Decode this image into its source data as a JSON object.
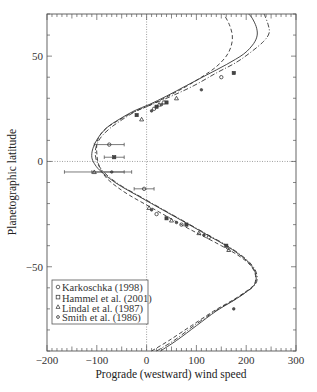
{
  "chart_data": {
    "type": "line",
    "title": "",
    "xlabel": "Prograde (westward) wind speed",
    "ylabel": "Planetographic latitude",
    "xlim": [
      -200,
      300
    ],
    "ylim": [
      -90,
      70
    ],
    "xticks": [
      -200,
      -100,
      0,
      100,
      200,
      300
    ],
    "xtick_labels": [
      "−200",
      "−100",
      "0",
      "100",
      "200",
      "300"
    ],
    "yticks": [
      50,
      0,
      -50
    ],
    "ytick_labels": [
      "50",
      "0",
      "−50"
    ],
    "grid": false,
    "reference_lines": {
      "x": 0,
      "y": 0,
      "style": "dotted"
    },
    "legend_position": "lower left",
    "legend": [
      {
        "label": "Karkoschka (1998)",
        "marker": "circle"
      },
      {
        "label": "Hammel et al. (2001)",
        "marker": "square"
      },
      {
        "label": "Lindal et al. (1987)",
        "marker": "triangle"
      },
      {
        "label": "Smith et al. (1986)",
        "marker": "small-circle"
      }
    ],
    "series": [
      {
        "name": "fit-solid",
        "style": "solid",
        "points": [
          [
            28,
            -90
          ],
          [
            60,
            -85
          ],
          [
            100,
            -78
          ],
          [
            140,
            -71
          ],
          [
            175,
            -66
          ],
          [
            200,
            -62
          ],
          [
            215,
            -59
          ],
          [
            220,
            -56
          ],
          [
            217,
            -52
          ],
          [
            205,
            -48
          ],
          [
            185,
            -44
          ],
          [
            160,
            -40
          ],
          [
            130,
            -36
          ],
          [
            100,
            -32
          ],
          [
            70,
            -28
          ],
          [
            40,
            -24
          ],
          [
            10,
            -20
          ],
          [
            -20,
            -16
          ],
          [
            -50,
            -12
          ],
          [
            -75,
            -8
          ],
          [
            -95,
            -4
          ],
          [
            -105,
            -1
          ],
          [
            -110,
            2
          ],
          [
            -108,
            6
          ],
          [
            -98,
            11
          ],
          [
            -80,
            16
          ],
          [
            -55,
            20
          ],
          [
            -25,
            24
          ],
          [
            5,
            27
          ],
          [
            40,
            31
          ],
          [
            80,
            36
          ],
          [
            120,
            41
          ],
          [
            160,
            46
          ],
          [
            195,
            51
          ],
          [
            215,
            56
          ],
          [
            222,
            60
          ],
          [
            220,
            64
          ],
          [
            212,
            68
          ],
          [
            205,
            70
          ]
        ]
      },
      {
        "name": "fit-dashed",
        "style": "dashed",
        "points": [
          [
            10,
            -90
          ],
          [
            45,
            -85
          ],
          [
            90,
            -78
          ],
          [
            135,
            -71
          ],
          [
            172,
            -66
          ],
          [
            198,
            -62
          ],
          [
            214,
            -59
          ],
          [
            219,
            -56
          ],
          [
            216,
            -52
          ],
          [
            203,
            -48
          ],
          [
            180,
            -44
          ],
          [
            150,
            -40
          ],
          [
            118,
            -36
          ],
          [
            85,
            -32
          ],
          [
            55,
            -28
          ],
          [
            25,
            -24
          ],
          [
            -5,
            -20
          ],
          [
            -35,
            -16
          ],
          [
            -60,
            -12
          ],
          [
            -80,
            -8
          ],
          [
            -92,
            -4
          ],
          [
            -98,
            0
          ],
          [
            -100,
            4
          ],
          [
            -100,
            8
          ],
          [
            -95,
            12
          ],
          [
            -80,
            16
          ],
          [
            -60,
            19
          ],
          [
            -30,
            23
          ],
          [
            0,
            26
          ],
          [
            35,
            30
          ],
          [
            75,
            35
          ],
          [
            110,
            40
          ],
          [
            140,
            45
          ],
          [
            160,
            50
          ],
          [
            170,
            55
          ],
          [
            172,
            60
          ],
          [
            166,
            65
          ],
          [
            155,
            70
          ]
        ]
      },
      {
        "name": "fit-dashdot",
        "style": "dashdot",
        "points": [
          [
            20,
            -90
          ],
          [
            55,
            -85
          ],
          [
            95,
            -78
          ],
          [
            138,
            -71
          ],
          [
            174,
            -66
          ],
          [
            200,
            -62
          ],
          [
            216,
            -59
          ],
          [
            222,
            -56
          ],
          [
            219,
            -52
          ],
          [
            207,
            -48
          ],
          [
            187,
            -44
          ],
          [
            162,
            -40
          ],
          [
            132,
            -36
          ],
          [
            102,
            -32
          ],
          [
            72,
            -28
          ],
          [
            42,
            -24
          ],
          [
            12,
            -20
          ],
          [
            -18,
            -16
          ],
          [
            -48,
            -12
          ],
          [
            -72,
            -8
          ],
          [
            -90,
            -4
          ],
          [
            -100,
            0
          ],
          [
            -103,
            4
          ],
          [
            -100,
            8
          ],
          [
            -90,
            12
          ],
          [
            -72,
            16
          ],
          [
            -48,
            20
          ],
          [
            -20,
            24
          ],
          [
            10,
            27
          ],
          [
            50,
            31
          ],
          [
            95,
            36
          ],
          [
            140,
            42
          ],
          [
            180,
            47
          ],
          [
            210,
            52
          ],
          [
            235,
            57
          ],
          [
            246,
            61
          ],
          [
            244,
            65
          ],
          [
            236,
            70
          ]
        ]
      },
      {
        "name": "observations",
        "style": "markers",
        "points": [
          [
            -75,
            8,
            30
          ],
          [
            -65,
            2,
            20
          ],
          [
            -105,
            -5,
            60
          ],
          [
            -70,
            -5,
            40
          ],
          [
            -5,
            -13,
            20
          ],
          [
            -20,
            22
          ],
          [
            -10,
            20
          ],
          [
            10,
            24
          ],
          [
            15,
            25
          ],
          [
            20,
            26
          ],
          [
            25,
            27
          ],
          [
            30,
            27
          ],
          [
            35,
            28
          ],
          [
            40,
            28
          ],
          [
            60,
            30
          ],
          [
            110,
            34
          ],
          [
            150,
            40
          ],
          [
            175,
            42
          ],
          [
            5,
            -22
          ],
          [
            10,
            -23
          ],
          [
            20,
            -25
          ],
          [
            40,
            -27
          ],
          [
            50,
            -28
          ],
          [
            60,
            -29
          ],
          [
            70,
            -30
          ],
          [
            80,
            -30
          ],
          [
            105,
            -34
          ],
          [
            115,
            -35
          ],
          [
            125,
            -36
          ],
          [
            160,
            -40
          ],
          [
            165,
            -42
          ],
          [
            175,
            -70
          ]
        ]
      }
    ]
  },
  "axes": {
    "x_label": "Prograde (westward) wind speed",
    "y_label": "Planetographic latitude"
  },
  "legend": {
    "items": [
      {
        "label": "Karkoschka (1998)"
      },
      {
        "label": "Hammel et al. (2001)"
      },
      {
        "label": "Lindal et al. (1987)"
      },
      {
        "label": "Smith et al. (1986)"
      }
    ]
  }
}
